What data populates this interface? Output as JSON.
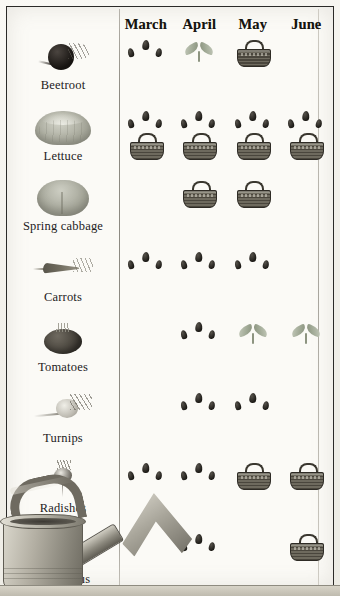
{
  "chart_data": {
    "type": "table",
    "xlabel": "Month",
    "ylabel": "Vegetable",
    "grid": true,
    "legend": [
      "seeds = sow",
      "sprout = plant out",
      "basket = harvest"
    ],
    "categories": [
      "March",
      "April",
      "May",
      "June"
    ],
    "series": [
      {
        "name": "Beetroot",
        "values": [
          "seeds",
          "sprout",
          "basket",
          ""
        ]
      },
      {
        "name": "Lettuce",
        "values": [
          "seeds+basket",
          "seeds+basket",
          "seeds+basket",
          "seeds+basket"
        ]
      },
      {
        "name": "Spring cabbage",
        "values": [
          "",
          "basket",
          "basket",
          ""
        ]
      },
      {
        "name": "Carrots",
        "values": [
          "seeds",
          "seeds",
          "seeds",
          ""
        ]
      },
      {
        "name": "Tomatoes",
        "values": [
          "",
          "seeds",
          "sprout",
          "sprout"
        ]
      },
      {
        "name": "Turnips",
        "values": [
          "",
          "seeds",
          "seeds",
          ""
        ]
      },
      {
        "name": "Radishes",
        "values": [
          "seeds",
          "seeds",
          "basket",
          "basket"
        ]
      },
      {
        "name": "Asparagus",
        "values": [
          "",
          "seeds",
          "",
          "basket"
        ]
      }
    ]
  },
  "header": {
    "months": [
      {
        "label": "March"
      },
      {
        "label": "April"
      },
      {
        "label": "May"
      },
      {
        "label": "June"
      }
    ]
  },
  "rows": [
    {
      "name": "Beetroot",
      "icon": "beetroot-illustration"
    },
    {
      "name": "Lettuce",
      "icon": "lettuce-illustration"
    },
    {
      "name": "Spring cabbage",
      "icon": "spring-cabbage-illustration"
    },
    {
      "name": "Carrots",
      "icon": "carrot-illustration"
    },
    {
      "name": "Tomatoes",
      "icon": "tomato-illustration"
    },
    {
      "name": "Turnips",
      "icon": "turnip-illustration"
    },
    {
      "name": "Radishes",
      "icon": "radish-illustration"
    },
    {
      "name": "Asparagus",
      "icon": "asparagus-illustration"
    }
  ],
  "decor": {
    "watering_can": "watering-can-illustration"
  },
  "colors": {
    "page": "#fbfaf6",
    "border": "#2b2a28",
    "rule": "#8d8a82",
    "ink": "#15140f",
    "seed": "#1d1b17",
    "basket": "#55514a",
    "sprout": "#9ea793"
  }
}
